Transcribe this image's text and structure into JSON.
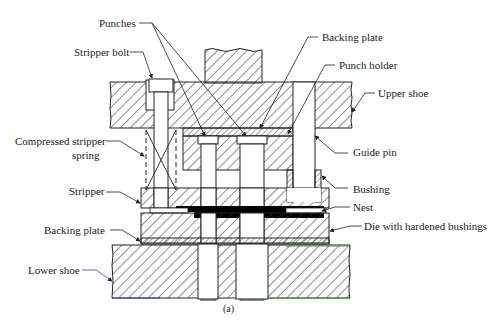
{
  "figure": {
    "caption": "(a)"
  },
  "labels": {
    "punches": "Punches",
    "stripper_bolt": "Stripper bolt",
    "backing_plate_top": "Backing plate",
    "punch_holder": "Punch holder",
    "upper_shoe": "Upper shoe",
    "compressed_spring_line1": "Compressed stripper",
    "compressed_spring_line2": "spring",
    "guide_pin": "Guide pin",
    "bushing": "Bushing",
    "stripper": "Stripper",
    "nest": "Nest",
    "die": "Die with hardened bushings",
    "backing_plate_bottom": "Backing plate",
    "lower_shoe": "Lower shoe"
  },
  "colors": {
    "line": "#222222",
    "hatch": "#333333",
    "strip": "#000000",
    "accent_blue": "#3344cc",
    "accent_green": "#33aa33"
  }
}
